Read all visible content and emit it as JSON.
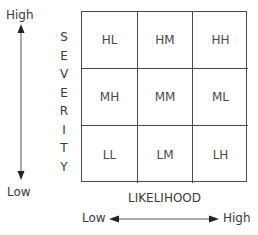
{
  "severity_axis": {
    "title_letters": [
      "S",
      "E",
      "V",
      "E",
      "R",
      "I",
      "T",
      "Y"
    ],
    "high_label": "High",
    "low_label": "Low"
  },
  "likelihood_axis": {
    "title": "LIKELIHOOD",
    "low_label": "Low",
    "high_label": "High"
  },
  "matrix": {
    "rows": [
      [
        "HL",
        "HM",
        "HH"
      ],
      [
        "MH",
        "MM",
        "ML"
      ],
      [
        "LL",
        "LM",
        "LH"
      ]
    ]
  },
  "colors": {
    "line": "#4a4a4a",
    "text": "#3a3a3a",
    "background": "#ffffff"
  }
}
